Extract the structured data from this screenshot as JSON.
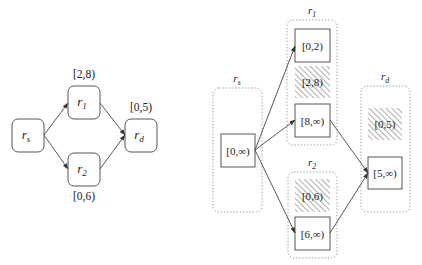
{
  "left_graph": {
    "nodes": [
      {
        "id": "rs",
        "name": "r",
        "sub": "s",
        "x": 12,
        "y": 119,
        "w": 32,
        "h": 33
      },
      {
        "id": "r1",
        "name": "r",
        "sub": "1",
        "x": 68,
        "y": 86,
        "w": 32,
        "h": 33,
        "interval": "[2,8)"
      },
      {
        "id": "r2",
        "name": "r",
        "sub": "2",
        "x": 68,
        "y": 153,
        "w": 32,
        "h": 33,
        "interval": "[0,6)"
      },
      {
        "id": "rd",
        "name": "r",
        "sub": "d",
        "x": 125,
        "y": 119,
        "w": 32,
        "h": 33,
        "interval": "[0,5)"
      }
    ],
    "interval_labels": [
      {
        "node": "r1",
        "text": "[2,8)",
        "x": 84,
        "y": 78
      },
      {
        "node": "rd",
        "text": "[0,5)",
        "x": 141,
        "y": 111
      },
      {
        "node": "r2",
        "text": "[0,6)",
        "x": 84,
        "y": 200
      }
    ],
    "edges": [
      {
        "from": "rs",
        "to": "r1",
        "x1": 44,
        "y1": 135,
        "x2": 68,
        "y2": 103
      },
      {
        "from": "rs",
        "to": "r2",
        "x1": 44,
        "y1": 135,
        "x2": 68,
        "y2": 169
      },
      {
        "from": "r1",
        "to": "rd",
        "x1": 100,
        "y1": 103,
        "x2": 125,
        "y2": 135
      },
      {
        "from": "r2",
        "to": "rd",
        "x1": 100,
        "y1": 169,
        "x2": 125,
        "y2": 135
      }
    ]
  },
  "right_graph": {
    "groups": [
      {
        "id": "rs",
        "name": "r",
        "sub": "s",
        "x": 213,
        "y": 88,
        "w": 49,
        "h": 124,
        "label_x": 237,
        "label_y": 82,
        "cells": [
          {
            "text": "[0,∞)",
            "x": 221,
            "y": 134,
            "w": 34,
            "h": 33,
            "blocked": false
          }
        ]
      },
      {
        "id": "r1",
        "name": "r",
        "sub": "1",
        "x": 287,
        "y": 20,
        "w": 50,
        "h": 125,
        "label_x": 312,
        "label_y": 14,
        "cells": [
          {
            "text": "[0,2)",
            "x": 295,
            "y": 29,
            "w": 35,
            "h": 33,
            "blocked": false
          },
          {
            "text": "[2,8)",
            "x": 295,
            "y": 66,
            "w": 35,
            "h": 32,
            "blocked": true
          },
          {
            "text": "[8,∞)",
            "x": 295,
            "y": 104,
            "w": 35,
            "h": 33,
            "blocked": false
          }
        ]
      },
      {
        "id": "r2",
        "name": "r",
        "sub": "2",
        "x": 288,
        "y": 172,
        "w": 49,
        "h": 86,
        "label_x": 312,
        "label_y": 166,
        "cells": [
          {
            "text": "[0,6)",
            "x": 295,
            "y": 179,
            "w": 35,
            "h": 33,
            "blocked": true
          },
          {
            "text": "[6,∞)",
            "x": 295,
            "y": 217,
            "w": 35,
            "h": 33,
            "blocked": false
          }
        ]
      },
      {
        "id": "rd",
        "name": "r",
        "sub": "d",
        "x": 361,
        "y": 86,
        "w": 49,
        "h": 126,
        "label_x": 385,
        "label_y": 80,
        "cells": [
          {
            "text": "[0,5)",
            "x": 368,
            "y": 108,
            "w": 34,
            "h": 32,
            "blocked": true
          },
          {
            "text": "[5,∞)",
            "x": 368,
            "y": 157,
            "w": 34,
            "h": 32,
            "blocked": false
          }
        ]
      }
    ],
    "edges": [
      {
        "from": "[0,∞)@rs",
        "to": "[0,2)@r1",
        "x1": 255,
        "y1": 150,
        "x2": 295,
        "y2": 46
      },
      {
        "from": "[0,∞)@rs",
        "to": "[8,∞)@r1",
        "x1": 255,
        "y1": 150,
        "x2": 295,
        "y2": 120
      },
      {
        "from": "[0,∞)@rs",
        "to": "[6,∞)@r2",
        "x1": 255,
        "y1": 150,
        "x2": 295,
        "y2": 233
      },
      {
        "from": "[8,∞)@r1",
        "to": "[5,∞)@rd",
        "x1": 330,
        "y1": 120,
        "x2": 368,
        "y2": 173
      },
      {
        "from": "[6,∞)@r2",
        "to": "[5,∞)@rd",
        "x1": 330,
        "y1": 233,
        "x2": 368,
        "y2": 173
      }
    ]
  },
  "colors": {
    "stroke": "#444444",
    "dotted": "#888888",
    "hatch": "#9a9a9a",
    "text": "#222222"
  }
}
